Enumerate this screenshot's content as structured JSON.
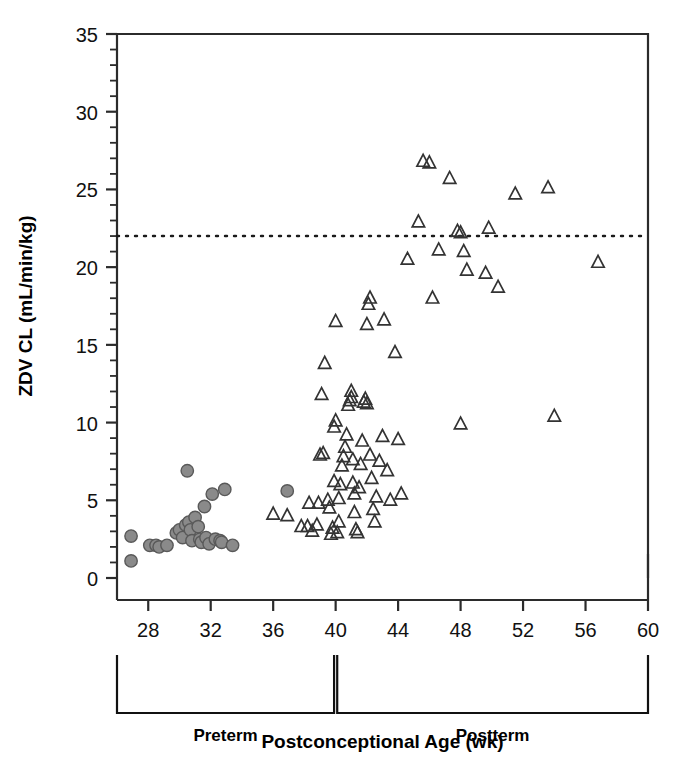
{
  "chart_data": {
    "type": "scatter",
    "title": "",
    "xlabel": "Postconceptional Age (wk)",
    "ylabel": "ZDV CL (mL/min/kg)",
    "xlim": [
      26,
      60
    ],
    "ylim": [
      0,
      35
    ],
    "xticks": [
      28,
      32,
      36,
      40,
      44,
      48,
      52,
      56,
      60
    ],
    "yticks": [
      0,
      5,
      10,
      15,
      20,
      25,
      30,
      35
    ],
    "x_minor_step": 2,
    "y_minor_step": 1,
    "grid": false,
    "legend": "none",
    "reference_line": {
      "name": "adult-mean-line",
      "orientation": "horizontal",
      "y": 22,
      "style": "dotted",
      "color": "#1a1a1a"
    },
    "group_brackets": [
      {
        "label": "Preterm",
        "x_start": 26,
        "x_end": 39.9
      },
      {
        "label": "Postterm",
        "x_start": 40.1,
        "x_end": 60
      }
    ],
    "series": [
      {
        "name": "Preterm",
        "marker": "circle",
        "filled": true,
        "color": "#8a8a8a",
        "edge_color": "#595959",
        "points": [
          [
            26.9,
            1.1
          ],
          [
            26.9,
            2.7
          ],
          [
            28.1,
            2.1
          ],
          [
            28.5,
            2.1
          ],
          [
            28.7,
            2.0
          ],
          [
            29.2,
            2.1
          ],
          [
            29.8,
            2.9
          ],
          [
            30.0,
            3.1
          ],
          [
            30.2,
            2.6
          ],
          [
            30.4,
            3.4
          ],
          [
            30.5,
            6.9
          ],
          [
            30.6,
            3.6
          ],
          [
            30.7,
            3.1
          ],
          [
            30.8,
            2.4
          ],
          [
            31.0,
            3.9
          ],
          [
            31.2,
            3.3
          ],
          [
            31.3,
            2.5
          ],
          [
            31.4,
            2.3
          ],
          [
            31.6,
            4.6
          ],
          [
            31.7,
            2.6
          ],
          [
            31.9,
            2.2
          ],
          [
            32.1,
            5.4
          ],
          [
            32.3,
            2.5
          ],
          [
            32.6,
            2.4
          ],
          [
            32.7,
            2.3
          ],
          [
            32.9,
            5.7
          ],
          [
            33.4,
            2.1
          ],
          [
            36.9,
            5.6
          ]
        ]
      },
      {
        "name": "Postterm",
        "marker": "triangle",
        "filled": false,
        "color": "#ffffff",
        "edge_color": "#333333",
        "points": [
          [
            36.0,
            4.1
          ],
          [
            36.9,
            4.0
          ],
          [
            37.8,
            3.3
          ],
          [
            38.2,
            3.3
          ],
          [
            38.5,
            3.0
          ],
          [
            38.8,
            3.4
          ],
          [
            38.3,
            4.8
          ],
          [
            38.9,
            4.8
          ],
          [
            39.0,
            7.9
          ],
          [
            39.2,
            8.0
          ],
          [
            39.1,
            11.8
          ],
          [
            39.3,
            13.8
          ],
          [
            39.5,
            5.0
          ],
          [
            39.6,
            4.5
          ],
          [
            39.7,
            2.8
          ],
          [
            39.8,
            3.2
          ],
          [
            39.9,
            6.2
          ],
          [
            39.9,
            9.7
          ],
          [
            40.0,
            10.1
          ],
          [
            40.0,
            16.5
          ],
          [
            40.1,
            2.9
          ],
          [
            40.2,
            3.6
          ],
          [
            40.2,
            5.1
          ],
          [
            40.3,
            6.0
          ],
          [
            40.4,
            7.2
          ],
          [
            40.5,
            7.8
          ],
          [
            40.6,
            8.4
          ],
          [
            40.7,
            9.2
          ],
          [
            40.8,
            11.1
          ],
          [
            40.9,
            11.4
          ],
          [
            41.0,
            11.6
          ],
          [
            41.0,
            12.0
          ],
          [
            41.1,
            7.6
          ],
          [
            41.1,
            6.1
          ],
          [
            41.2,
            5.4
          ],
          [
            41.2,
            4.2
          ],
          [
            41.3,
            3.1
          ],
          [
            41.4,
            2.9
          ],
          [
            41.5,
            5.8
          ],
          [
            41.6,
            7.3
          ],
          [
            41.7,
            8.8
          ],
          [
            41.8,
            11.3
          ],
          [
            41.9,
            11.5
          ],
          [
            42.0,
            16.3
          ],
          [
            42.1,
            17.6
          ],
          [
            42.2,
            18.0
          ],
          [
            42.0,
            11.2
          ],
          [
            42.2,
            7.9
          ],
          [
            42.3,
            6.4
          ],
          [
            42.4,
            4.4
          ],
          [
            42.5,
            3.6
          ],
          [
            42.6,
            5.2
          ],
          [
            42.8,
            7.5
          ],
          [
            43.0,
            9.1
          ],
          [
            43.1,
            16.6
          ],
          [
            43.3,
            6.9
          ],
          [
            43.5,
            5.0
          ],
          [
            43.8,
            14.5
          ],
          [
            44.0,
            8.9
          ],
          [
            44.2,
            5.4
          ],
          [
            44.6,
            20.5
          ],
          [
            45.3,
            22.9
          ],
          [
            45.6,
            26.8
          ],
          [
            46.0,
            26.7
          ],
          [
            46.2,
            18.0
          ],
          [
            46.6,
            21.1
          ],
          [
            47.3,
            25.7
          ],
          [
            47.8,
            22.3
          ],
          [
            48.0,
            22.2
          ],
          [
            48.2,
            21.0
          ],
          [
            48.4,
            19.8
          ],
          [
            48.0,
            9.9
          ],
          [
            49.6,
            19.6
          ],
          [
            49.8,
            22.5
          ],
          [
            50.4,
            18.7
          ],
          [
            51.5,
            24.7
          ],
          [
            53.6,
            25.1
          ],
          [
            54.0,
            10.4
          ],
          [
            56.8,
            20.3
          ]
        ]
      }
    ]
  }
}
